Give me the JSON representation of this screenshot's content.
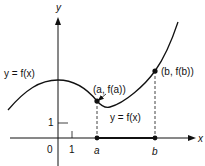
{
  "diagram": {
    "axes": {
      "x_label": "x",
      "y_label": "y",
      "origin_label": "0",
      "x_tick_label": "1",
      "y_tick_label": "1"
    },
    "points": {
      "a": {
        "axis_label": "a",
        "curve_label": "(a, f(a))"
      },
      "b": {
        "axis_label": "b",
        "curve_label": "(b, f(b))"
      }
    },
    "curve_labels": {
      "left": "y = f(x)",
      "middle": "y = f(x)"
    },
    "colors": {
      "ink": "#111111",
      "background": "#ffffff"
    }
  }
}
